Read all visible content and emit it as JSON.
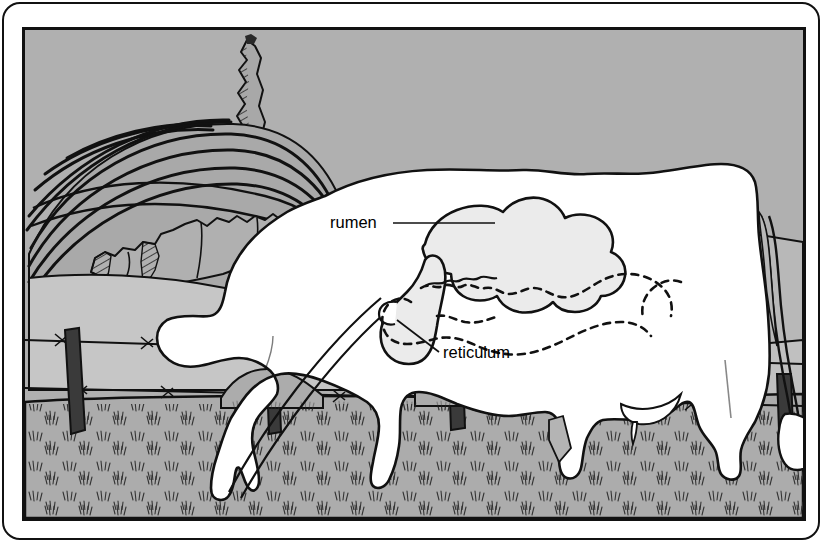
{
  "figure": {
    "kind": "anatomical-illustration",
    "labels": [
      {
        "id": "rumen",
        "text": "rumen",
        "x": 327,
        "y": 221,
        "leader_from": [
          390,
          216
        ],
        "leader_to": [
          487,
          216
        ]
      },
      {
        "id": "reticulum",
        "text": "reticulum",
        "x": 440,
        "y": 351,
        "leader_from": [
          436,
          344
        ],
        "leader_to": [
          396,
          310
        ]
      }
    ],
    "organs": [
      {
        "name": "rumen",
        "style": "solid-outline-filled"
      },
      {
        "name": "reticulum",
        "style": "solid-outline-filled"
      },
      {
        "name": "esophagus",
        "style": "double-line-tube"
      },
      {
        "name": "intestines",
        "style": "dashed-outline"
      }
    ],
    "scene": {
      "sky": "plain gray backdrop",
      "hills": [
        "contour-plowed hill",
        "pasture hill left",
        "pasture hill right"
      ],
      "vegetation": [
        "tall cypress tree",
        "hedgerow bushes"
      ],
      "fence": {
        "type": "barbed-wire",
        "wires": 2,
        "posts": 4
      },
      "ground": "stippled grass pasture",
      "animal": {
        "species": "cow",
        "pose": "head-down grazing",
        "features": [
          "tail with tuft",
          "udder",
          "four legs"
        ]
      }
    }
  },
  "colors": {
    "sky": "#b0b0b0",
    "hill_light": "#c6c6c6",
    "hill_mid": "#b8b8b8",
    "hill_plowed": "#a9a9a9",
    "ground": "#acacac",
    "tree": "#a8a8a8",
    "cow_body": "#ffffff",
    "organ_fill": "#ebebeb",
    "post": "#3a3a3a",
    "ink": "#111111",
    "frame": "#111111",
    "page": "#ffffff"
  },
  "dimensions": {
    "width": 827,
    "height": 548,
    "image_left": 22,
    "image_top": 27,
    "image_width": 784,
    "image_height": 494
  }
}
